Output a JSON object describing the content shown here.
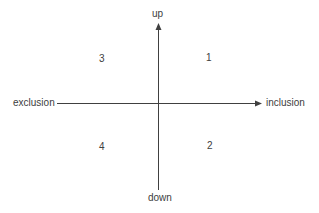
{
  "diagram": {
    "type": "quadrant",
    "axes": {
      "horizontal": {
        "left_label": "exclusion",
        "right_label": "inclusion",
        "arrow": "right"
      },
      "vertical": {
        "top_label": "up",
        "bottom_label": "down",
        "arrow": "up"
      }
    },
    "quadrants": [
      {
        "position": "top-right",
        "label": "1"
      },
      {
        "position": "bottom-right",
        "label": "2"
      },
      {
        "position": "top-left",
        "label": "3"
      },
      {
        "position": "bottom-left",
        "label": "4"
      }
    ],
    "colors": {
      "line": "#404040",
      "text": "#404040",
      "background": "#ffffff"
    }
  }
}
